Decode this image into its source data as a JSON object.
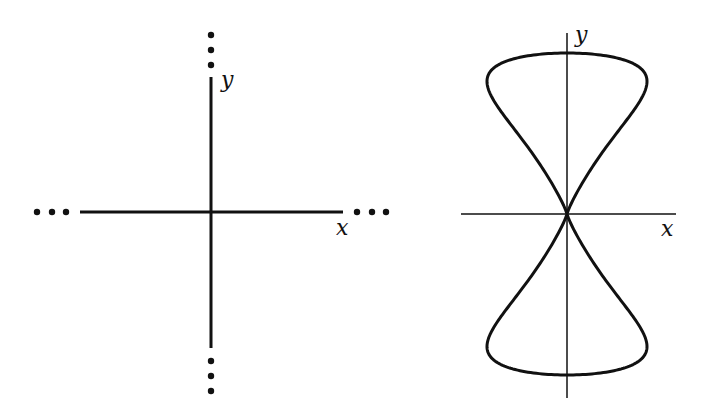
{
  "figures": [
    {
      "id": "left",
      "description": "Coordinate axes extending infinitely in both directions",
      "x_label": "x",
      "y_label": "y",
      "continuation_marker": "…",
      "origin": [
        211,
        212
      ],
      "x_axis": {
        "from": 80,
        "to": 343
      },
      "y_axis": {
        "from": 77,
        "to": 348
      },
      "dots": {
        "top": [
          35,
          50,
          65
        ],
        "bottom": [
          361,
          376,
          391
        ],
        "left": [
          37,
          52,
          66
        ],
        "right": [
          357,
          372,
          386
        ]
      }
    },
    {
      "id": "right",
      "description": "Figure-eight curve symmetric about both axes, crossing at the origin",
      "x_label": "x",
      "y_label": "y",
      "origin": [
        567,
        214
      ],
      "x_axis": {
        "from": 461,
        "to": 676
      },
      "y_axis": {
        "from": 33,
        "to": 398
      },
      "curve": {
        "type": "figure-eight",
        "half_height": 161,
        "half_width": 80
      }
    }
  ],
  "colors": {
    "stroke": "#111111",
    "background": "#ffffff"
  }
}
